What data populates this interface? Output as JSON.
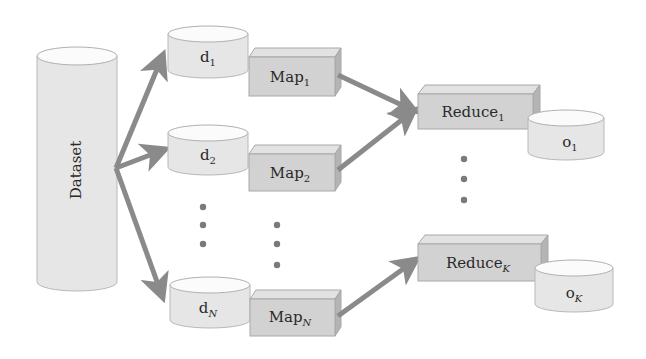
{
  "diagram": {
    "dataset": {
      "label": "Dataset"
    },
    "splits": [
      {
        "base": "d",
        "sub": "1"
      },
      {
        "base": "d",
        "sub": "2"
      },
      {
        "base": "d",
        "sub": "N"
      }
    ],
    "mappers": [
      {
        "base": "Map",
        "sub": "1"
      },
      {
        "base": "Map",
        "sub": "2"
      },
      {
        "base": "Map",
        "sub": "N"
      }
    ],
    "reducers": [
      {
        "base": "Reduce",
        "sub": "1"
      },
      {
        "base": "Reduce",
        "sub": "K"
      }
    ],
    "outputs": [
      {
        "base": "o",
        "sub": "1"
      },
      {
        "base": "o",
        "sub": "K"
      }
    ],
    "colors": {
      "cylinder_fill": "#e6e6e6",
      "box_fill": "#d2d2d2",
      "box_top": "#e2e2e2",
      "box_side": "#b4b4b4",
      "arrow": "#8a8a8a",
      "outline": "#a8a8a8",
      "text": "#2a2a2a"
    }
  }
}
